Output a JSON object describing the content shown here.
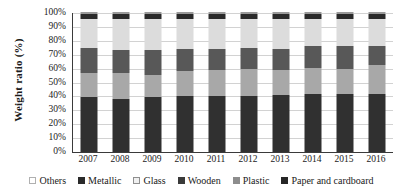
{
  "chart_data": {
    "type": "bar",
    "stacked": true,
    "title": "",
    "xlabel": "",
    "ylabel": "Weight ratio (%)",
    "ylim": [
      0,
      100
    ],
    "ytick_labels": [
      "100%",
      "90%",
      "80%",
      "70%",
      "60%",
      "50%",
      "40%",
      "30%",
      "20%",
      "10%",
      "0%"
    ],
    "ytick_values": [
      100,
      90,
      80,
      70,
      60,
      50,
      40,
      30,
      20,
      10,
      0
    ],
    "grid": true,
    "legend_position": "bottom",
    "categories": [
      "2007",
      "2008",
      "2009",
      "2010",
      "2011",
      "2012",
      "2013",
      "2014",
      "2015",
      "2016"
    ],
    "series": [
      {
        "name": "Paper and cardboard",
        "color": "#303030",
        "values": [
          39.5,
          38.5,
          39.5,
          40.5,
          40.5,
          40.5,
          41.0,
          42.0,
          42.0,
          41.5
        ]
      },
      {
        "name": "Plastic",
        "color": "#a8a8a8",
        "values": [
          17.5,
          18.0,
          16.0,
          18.0,
          18.5,
          19.5,
          18.0,
          18.5,
          17.5,
          21.0
        ]
      },
      {
        "name": "Wooden",
        "color": "#585858",
        "values": [
          17.5,
          17.0,
          18.0,
          15.5,
          15.0,
          14.5,
          15.0,
          15.5,
          16.5,
          13.5
        ]
      },
      {
        "name": "Glass",
        "color": "#dcdcdc",
        "values": [
          21.5,
          22.5,
          22.5,
          22.0,
          21.5,
          21.5,
          22.0,
          20.0,
          20.0,
          20.0
        ]
      },
      {
        "name": "Metallic",
        "color": "#2a2a2a",
        "values": [
          3.0,
          3.0,
          3.0,
          3.0,
          3.5,
          3.0,
          3.0,
          3.0,
          3.0,
          3.0
        ]
      },
      {
        "name": "Others",
        "color": "#ffffff",
        "values": [
          1.0,
          1.0,
          1.0,
          1.0,
          1.0,
          1.0,
          1.0,
          1.0,
          1.0,
          1.0
        ]
      }
    ]
  },
  "legend": {
    "items": [
      {
        "label": "Others",
        "swatch": "sw-others"
      },
      {
        "label": "Metallic",
        "swatch": "sw-metallic"
      },
      {
        "label": "Glass",
        "swatch": "sw-glass"
      },
      {
        "label": "Wooden",
        "swatch": "sw-wooden"
      },
      {
        "label": "Plastic",
        "swatch": "sw-plastic"
      },
      {
        "label": "Paper and cardboard",
        "swatch": "sw-paper"
      }
    ]
  }
}
